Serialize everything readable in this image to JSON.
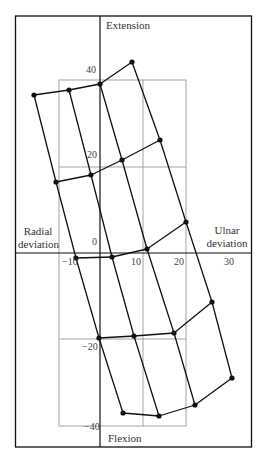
{
  "labels": {
    "extension": "Extension",
    "flexion": "Flexion",
    "radial_line1": "Radial",
    "radial_line2": "deviation",
    "ulnar_line1": "Ulnar",
    "ulnar_line2": "deviation"
  },
  "ticks": {
    "y40": "40",
    "y20": "20",
    "y0": "0",
    "yneg20": "−20",
    "yneg40": "−40",
    "xneg10": "−10",
    "x10": "10",
    "x20": "20",
    "x30": "30"
  },
  "colors": {
    "frame": "#111111",
    "grid": "#9a9a9a",
    "mesh": "#111111"
  },
  "mesh_points": [
    [
      [
        34,
        95
      ],
      [
        69,
        90
      ],
      [
        100,
        84
      ],
      [
        132,
        62
      ]
    ],
    [
      [
        56,
        182
      ],
      [
        91,
        175
      ],
      [
        122,
        160
      ],
      [
        160,
        140
      ]
    ],
    [
      [
        76,
        258
      ],
      [
        112,
        257
      ],
      [
        147,
        249
      ],
      [
        186,
        222
      ]
    ],
    [
      [
        99,
        338
      ],
      [
        134,
        336
      ],
      [
        174,
        333
      ],
      [
        212,
        302
      ]
    ],
    [
      [
        123,
        413
      ],
      [
        159,
        416
      ],
      [
        195,
        405
      ],
      [
        232,
        378
      ]
    ]
  ]
}
